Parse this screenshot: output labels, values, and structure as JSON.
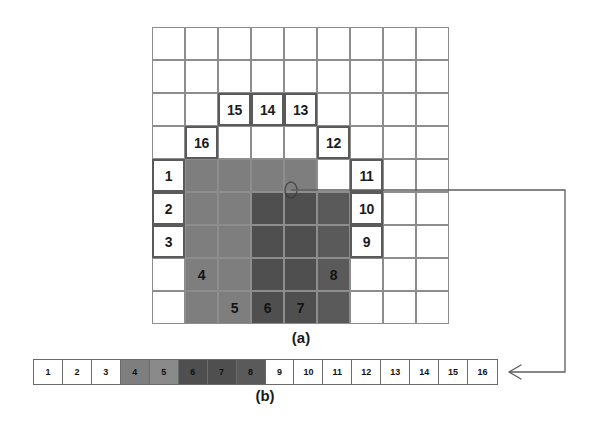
{
  "figure": {
    "panels": [
      {
        "id": "a",
        "caption": "(a)",
        "description": "spiral-scan-grid"
      },
      {
        "id": "b",
        "caption": "(b)",
        "description": "unrolled-linear-sequence"
      }
    ]
  },
  "colors": {
    "background": "#ffffff",
    "grid_line": "#8d8d8d",
    "cell_border_strong": "#5a5a5a",
    "shade_medium": "#7c7c7c",
    "shade_dark": "#5a5a5a",
    "shade_darker": "#4b4b4b",
    "text": "#1c1c1c",
    "connector": "#5d5d5d"
  },
  "grid": {
    "rows": 9,
    "columns": 9,
    "cell_size": 33,
    "numbered_cells": [
      {
        "label": "1",
        "row": 4,
        "col": 0,
        "style": "white"
      },
      {
        "label": "2",
        "row": 5,
        "col": 0,
        "style": "white"
      },
      {
        "label": "3",
        "row": 6,
        "col": 0,
        "style": "white"
      },
      {
        "label": "4",
        "row": 7,
        "col": 1,
        "style": "onshade"
      },
      {
        "label": "5",
        "row": 8,
        "col": 2,
        "style": "onshade"
      },
      {
        "label": "6",
        "row": 8,
        "col": 3,
        "style": "onshade"
      },
      {
        "label": "7",
        "row": 8,
        "col": 4,
        "style": "onshade"
      },
      {
        "label": "8",
        "row": 7,
        "col": 5,
        "style": "onshade"
      },
      {
        "label": "9",
        "row": 6,
        "col": 6,
        "style": "white"
      },
      {
        "label": "10",
        "row": 5,
        "col": 6,
        "style": "white"
      },
      {
        "label": "11",
        "row": 4,
        "col": 6,
        "style": "white"
      },
      {
        "label": "12",
        "row": 3,
        "col": 5,
        "style": "white"
      },
      {
        "label": "13",
        "row": 2,
        "col": 4,
        "style": "white"
      },
      {
        "label": "14",
        "row": 2,
        "col": 3,
        "style": "white"
      },
      {
        "label": "15",
        "row": 2,
        "col": 2,
        "style": "white"
      },
      {
        "label": "16",
        "row": 3,
        "col": 1,
        "style": "white"
      }
    ],
    "shaded_regions": [
      {
        "name": "medium-left-block",
        "row": 4,
        "col": 1,
        "rows": 5,
        "cols": 2,
        "tone": "#7e7e7e"
      },
      {
        "name": "medium-top-block",
        "row": 4,
        "col": 3,
        "rows": 1,
        "cols": 2,
        "tone": "#7e7e7e"
      },
      {
        "name": "dark-core-block",
        "row": 5,
        "col": 3,
        "rows": 4,
        "cols": 2,
        "tone": "#4f4f4f"
      },
      {
        "name": "dark-right-block",
        "row": 5,
        "col": 5,
        "rows": 4,
        "cols": 1,
        "tone": "#5a5a5a"
      }
    ]
  },
  "strip": {
    "cells": [
      {
        "label": "1",
        "tone": "#ffffff"
      },
      {
        "label": "2",
        "tone": "#ffffff"
      },
      {
        "label": "3",
        "tone": "#ffffff"
      },
      {
        "label": "4",
        "tone": "#7e7e7e"
      },
      {
        "label": "5",
        "tone": "#8a8a8a"
      },
      {
        "label": "6",
        "tone": "#4f4f4f"
      },
      {
        "label": "7",
        "tone": "#4f4f4f"
      },
      {
        "label": "8",
        "tone": "#5a5a5a"
      },
      {
        "label": "9",
        "tone": "#ffffff"
      },
      {
        "label": "10",
        "tone": "#ffffff"
      },
      {
        "label": "11",
        "tone": "#ffffff"
      },
      {
        "label": "12",
        "tone": "#ffffff"
      },
      {
        "label": "13",
        "tone": "#ffffff"
      },
      {
        "label": "14",
        "tone": "#ffffff"
      },
      {
        "label": "15",
        "tone": "#ffffff"
      },
      {
        "label": "16",
        "tone": "#ffffff"
      }
    ]
  },
  "captions": {
    "panel_a": "(a)",
    "panel_b": "(b)"
  }
}
